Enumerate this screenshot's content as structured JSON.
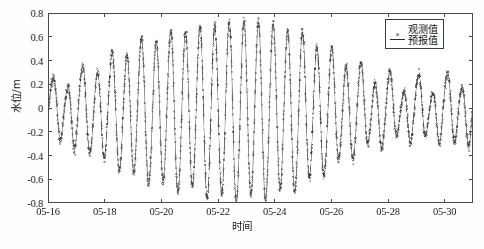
{
  "chart_data": {
    "type": "scatter",
    "title": "",
    "xlabel": "时间",
    "ylabel": "水位/m",
    "ylim": [
      -0.8,
      0.8
    ],
    "xlim": [
      "05-16",
      "05-31"
    ],
    "grid": false,
    "legend_position": "top-right-inside",
    "y_ticks": [
      "0.8",
      "0.6",
      "0.4",
      "0.2",
      "0",
      "-0.2",
      "-0.4",
      "-0.6",
      "-0.8"
    ],
    "y_tick_values": [
      0.8,
      0.6,
      0.4,
      0.2,
      0,
      -0.2,
      -0.4,
      -0.6,
      -0.8
    ],
    "x_ticks": [
      "05-16",
      "05-18",
      "05-20",
      "05-22",
      "05-24",
      "05-26",
      "05-28",
      "05-30"
    ],
    "x_tick_days": [
      0,
      2,
      4,
      6,
      8,
      10,
      12,
      14
    ],
    "series": [
      {
        "name": "观测值",
        "style": "scatter",
        "marker": "x",
        "color": "#3a3a3a",
        "noise_amplitude": 0.035
      },
      {
        "name": "预报值",
        "style": "line",
        "color": "#5a5a5a",
        "linewidth": 0.8
      }
    ],
    "tide_model": {
      "description": "Semidiurnal tide with spring-neap modulation; amplitude grows from 05-16 to a spring maximum near 05-21 to 05-23 then decays toward neap by 05-30.",
      "mean_level": -0.02,
      "period_hours": 12.42,
      "samples_per_day": 48,
      "total_days": 15,
      "envelope_days": [
        0,
        1,
        2,
        3,
        4,
        5,
        6,
        7,
        8,
        9,
        10,
        11,
        12,
        13,
        14,
        15
      ],
      "envelope_amplitude": [
        0.21,
        0.26,
        0.34,
        0.47,
        0.56,
        0.64,
        0.71,
        0.74,
        0.72,
        0.66,
        0.55,
        0.45,
        0.38,
        0.33,
        0.3,
        0.31
      ],
      "secondary_amplitude": [
        0.1,
        0.11,
        0.1,
        0.09,
        0.07,
        0.05,
        0.04,
        0.04,
        0.05,
        0.07,
        0.09,
        0.11,
        0.12,
        0.12,
        0.11,
        0.1
      ],
      "diurnal_amplitude": [
        0.07,
        0.07,
        0.06,
        0.06,
        0.05,
        0.04,
        0.03,
        0.03,
        0.04,
        0.05,
        0.06,
        0.07,
        0.08,
        0.08,
        0.08,
        0.07
      ],
      "peak_max": 0.76,
      "trough_min": -0.72
    }
  },
  "legend": {
    "items": [
      {
        "label": "观测值",
        "key": "marker-x"
      },
      {
        "label": "预报值",
        "key": "line"
      }
    ]
  },
  "axes": {
    "y_title": "水位/m",
    "x_title": "时间"
  },
  "caption": {
    "text": ""
  }
}
